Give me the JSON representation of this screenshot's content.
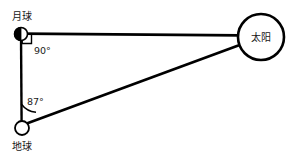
{
  "diagram": {
    "background_color": "#ffffff",
    "line_color": "#000000",
    "text_color": "#151515",
    "bodies": {
      "moon": {
        "label": "月球",
        "marker": "half-filled-circle",
        "cx": 21,
        "cy": 34,
        "r": 6.5,
        "fill": "#ffffff",
        "half_fill": "#000000"
      },
      "earth": {
        "label": "地球",
        "marker": "open-circle",
        "cx": 22,
        "cy": 128,
        "r": 7,
        "fill": "#ffffff"
      },
      "sun": {
        "label": "太阳",
        "marker": "open-circle",
        "cx": 261,
        "cy": 37,
        "r": 23,
        "fill": "#ffffff"
      }
    },
    "angles": [
      {
        "id": "moon-angle",
        "label": "90°",
        "vertex": "moon",
        "marker": "right-angle-square",
        "value": 90,
        "unit": "degree"
      },
      {
        "id": "earth-angle",
        "label": "87°",
        "vertex": "earth",
        "marker": "arc",
        "value": 87,
        "unit": "degree"
      }
    ],
    "segments": [
      {
        "id": "moon-earth",
        "from": "moon",
        "to": "earth"
      },
      {
        "id": "moon-sun",
        "from": "moon",
        "to": "sun"
      },
      {
        "id": "earth-sun",
        "from": "earth",
        "to": "sun"
      }
    ]
  }
}
